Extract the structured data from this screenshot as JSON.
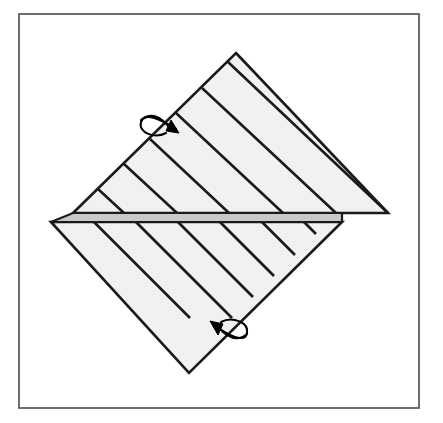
{
  "figure": {
    "canvas": {
      "width": 443,
      "height": 423,
      "background": "#ffffff"
    },
    "frame": {
      "label": "figure-border",
      "x": 19,
      "y": 14,
      "width": 400,
      "height": 394,
      "stroke": "#4a4a4a",
      "stroke_width": 1.6,
      "fill": "none"
    },
    "palette": {
      "sheet_fill": "#f1f1ef",
      "band_fill": "#c9c9c9",
      "outline": "#1a1a1a",
      "arrow": "#000000",
      "background": "#ffffff"
    },
    "upper_sheet": {
      "label": "upper-triangle",
      "points": "236,53 388,213 73,213",
      "fill": "#f1f1ef",
      "stroke": "#1a1a1a",
      "stroke_width": 2.6,
      "crease_count": 6,
      "crease_direction": "parallel-to-upper-left-edge",
      "creases": [
        "150,139 229,213",
        "124,164 177,213",
        "98,189 124,213",
        "176,113 283,213",
        "202,88 336,213",
        "228,62 388,213"
      ]
    },
    "lower_sheet": {
      "label": "lower-triangle",
      "points": "51,222 342,222 189,373",
      "fill": "#f1f1ef",
      "stroke": "#1a1a1a",
      "stroke_width": 2.6,
      "crease_count": 6,
      "crease_direction": "parallel-to-lower-right-edge",
      "creases": [
        "94,222 190,318",
        "136,222 232,318",
        "178,222 253,297",
        "220,222 274,276",
        "262,222 295,255",
        "304,222 316,234"
      ]
    },
    "band": {
      "label": "fold-band",
      "points": "73,213 342,213 342,222 51,222",
      "fill": "#c9c9c9",
      "stroke": "#1a1a1a",
      "stroke_width": 2.2
    },
    "arrows": [
      {
        "name": "upper-fold-arrow",
        "description": "curved loop arrow wrapping the upper-left edge, pointing down-right",
        "loop_path": "M 176,129 C 162,120 144,111 141,122 C 138,133 155,139 166,133",
        "tail_path": "M 141,120 C 151,112 160,116 170,128",
        "head_points": "179,133 166,131 171,120",
        "direction": "down-right",
        "stroke": "#000000",
        "stroke_width": 2.1
      },
      {
        "name": "lower-fold-arrow",
        "description": "curved loop arrow wrapping the lower-right edge, pointing up-left",
        "loop_path": "M 214,325 C 228,335 245,344 247,333 C 249,322 232,316 221,322",
        "tail_path": "M 247,334 C 238,342 228,338 218,327",
        "head_points": "210,321 223,324 218,335",
        "direction": "up-left",
        "stroke": "#000000",
        "stroke_width": 2.1
      }
    ]
  }
}
